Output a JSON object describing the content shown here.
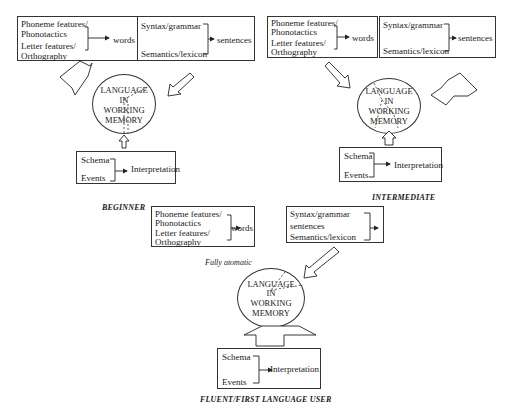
{
  "stages": {
    "beginner": {
      "label": "BEGINNER",
      "word_box": {
        "line1": "Phoneme features/",
        "line2": "Phonotactics",
        "line3": "Letter features/",
        "line4": "Orthography",
        "output": "words"
      },
      "sentence_box": {
        "line1": "Syntax/grammar",
        "line2": "Semantics/lexicon",
        "output": "sentences"
      },
      "memory": {
        "line1": "LANGUAGE",
        "line2": "IN",
        "line3": "WORKING",
        "line4": "MEMORY"
      },
      "schema_box": {
        "line1": "Schema",
        "line2": "Events",
        "output": "Interpretation"
      }
    },
    "intermediate": {
      "label": "INTERMEDIATE",
      "word_box": {
        "line1": "Phoneme features/",
        "line2": "Phonotactics",
        "line3": "Letter features/",
        "line4": "Orthography",
        "output": "words"
      },
      "sentence_box": {
        "line1": "Syntax/grammar",
        "line2": "Semantics/lexicon",
        "output": "sentences"
      },
      "memory": {
        "line1": "LANGUAGE",
        "line2": "IN",
        "line3": "WORKING",
        "line4": "MEMORY"
      },
      "schema_box": {
        "line1": "Schema",
        "line2": "Events",
        "output": "Interpretation"
      }
    },
    "fluent": {
      "label": "FLUENT/FIRST LANGUAGE USER",
      "note": "Fully atomatic",
      "word_box": {
        "line1": "Phoneme features/",
        "line2": "Phonotactics",
        "line3": "Letter features/",
        "line4": "Orthography",
        "output": "words"
      },
      "sentence_box": {
        "line1": "Syntax/grammar",
        "line2": "sentences",
        "line3": "Semantics/lexicon"
      },
      "memory": {
        "line1": "LANGUAGE",
        "line2": "IN",
        "line3": "WORKING",
        "line4": "MEMORY"
      },
      "schema_box": {
        "line1": "Schema",
        "line2": "Events",
        "output": "Interpretation"
      }
    }
  }
}
